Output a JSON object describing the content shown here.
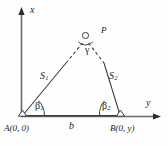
{
  "figure": {
    "kind": "triangulation-geometry-diagram",
    "stroke_color": "#3a3a3a",
    "text_color": "#1c1c1c",
    "background_color": "#fefefe"
  },
  "axes": {
    "x_label": "x",
    "y_label": "y",
    "x_axis": {
      "orientation": "vertical",
      "arrow": "up",
      "x": 21,
      "y_top": 13,
      "y_bottom": 116
    },
    "y_axis": {
      "orientation": "horizontal",
      "arrow": "right",
      "y": 116,
      "x_left": 21,
      "x_right": 160
    }
  },
  "points": {
    "a": {
      "label": "A",
      "coords": "(0, 0)",
      "marker": "triangle-station",
      "x": 22,
      "y": 116
    },
    "b": {
      "label": "B",
      "coords": "(0, y)",
      "marker": "triangle-station",
      "x": 121,
      "y": 116
    },
    "p": {
      "label": "P",
      "marker": "circle-station",
      "x": 85,
      "y": 35
    }
  },
  "labels": {
    "point_a": "A",
    "point_a_coords": "(0, 0)",
    "point_b": "B",
    "point_b_coords": "(0, y)",
    "point_p": "P",
    "side_s1": "S",
    "side_s1_sub": "1",
    "side_s2": "S",
    "side_s2_sub": "2",
    "base_b": "b",
    "angle_beta1": "β",
    "angle_beta1_sub": "1",
    "angle_beta2": "β",
    "angle_beta2_sub": "2",
    "angle_gamma": "γ"
  },
  "segments": [
    {
      "name": "side-s1",
      "from": "A",
      "to": "P",
      "style": "solid-then-dashed",
      "label": "S1"
    },
    {
      "name": "side-s2",
      "from": "P",
      "to": "B",
      "style": "dashed-then-solid",
      "label": "S2"
    },
    {
      "name": "base-b",
      "from": "A",
      "to": "B",
      "style": "solid",
      "label": "b"
    }
  ],
  "angles": [
    {
      "name": "beta1",
      "vertex": "A",
      "label": "β1"
    },
    {
      "name": "beta2",
      "vertex": "B",
      "label": "β2"
    },
    {
      "name": "gamma",
      "vertex": "P",
      "label": "γ"
    }
  ]
}
